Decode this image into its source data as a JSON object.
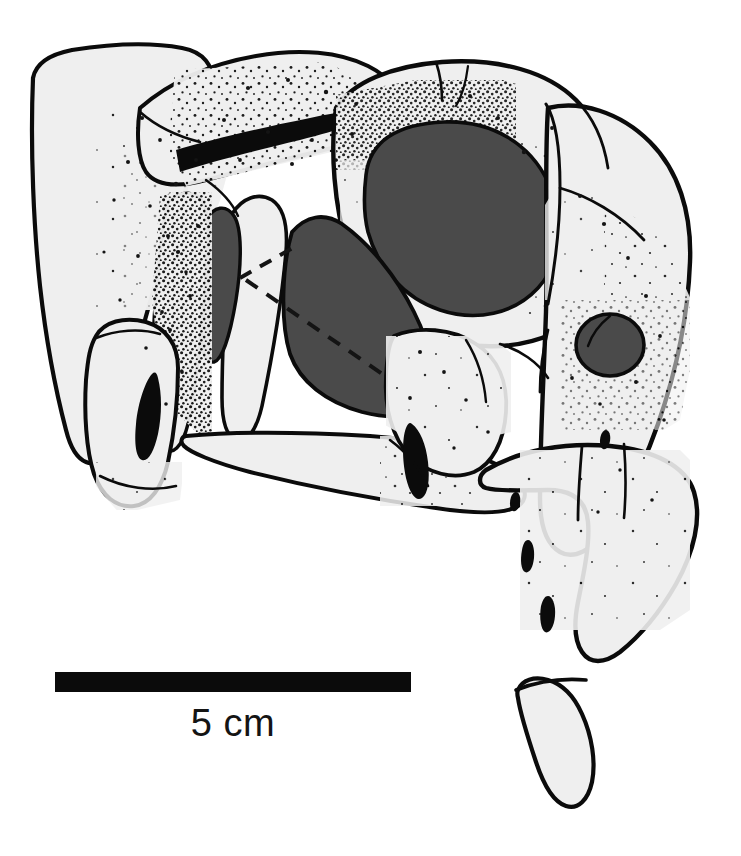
{
  "figure": {
    "kind": "scientific-line-illustration",
    "background_color": "#ffffff",
    "ink_color": "#0b0b0b",
    "bone_fill_color": "#efefef",
    "fenestra_fill_color": "#4a4a4a",
    "naris_fill_color": "#4a4a4a",
    "orbit_fill_color": "#4a4a4a",
    "stipple_color": "#111111"
  },
  "scale_bar": {
    "label": "5 cm",
    "length_px": 356,
    "thickness_px": 20,
    "bar_color": "#0b0b0b",
    "value": 5,
    "unit": "cm"
  },
  "openings": [
    {
      "name": "orbit",
      "fill": "#4a4a4a"
    },
    {
      "name": "antorbital-fenestra",
      "fill": "#4a4a4a"
    },
    {
      "name": "accessory-fenestra",
      "fill": "#4a4a4a"
    },
    {
      "name": "external-naris",
      "fill": "#4a4a4a"
    }
  ],
  "annotations": {
    "dashed_line_style": "dashed",
    "dashed_line_color": "#141414"
  }
}
